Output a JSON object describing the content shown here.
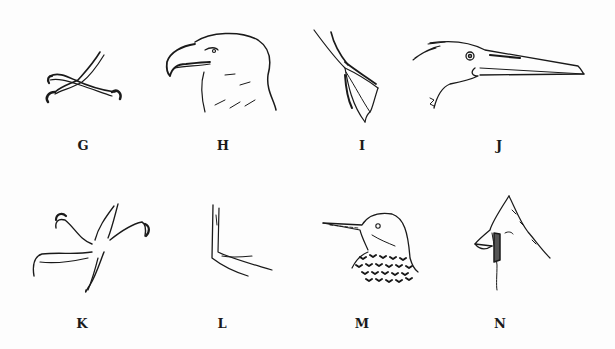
{
  "figure": {
    "background": "#fdfdfd",
    "ink": "#1a1a1a",
    "panels": [
      {
        "id": "G",
        "label": "G",
        "subject": "crossed-zygodactyl-feet"
      },
      {
        "id": "H",
        "label": "H",
        "subject": "eagle-head"
      },
      {
        "id": "I",
        "label": "I",
        "subject": "webbed-foot"
      },
      {
        "id": "J",
        "label": "J",
        "subject": "long-billed-heron-head"
      },
      {
        "id": "K",
        "label": "K",
        "subject": "raptor-talon-foot"
      },
      {
        "id": "L",
        "label": "L",
        "subject": "perching-foot"
      },
      {
        "id": "M",
        "label": "M",
        "subject": "woodpecker-flicker-head"
      },
      {
        "id": "N",
        "label": "N",
        "subject": "cardinal-crested-head"
      }
    ]
  }
}
